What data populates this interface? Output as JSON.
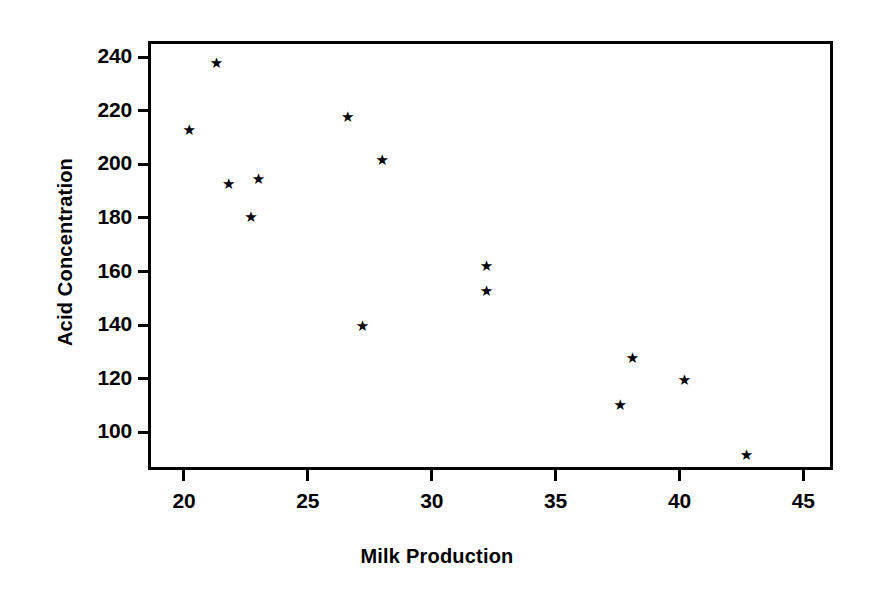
{
  "chart_data": {
    "type": "scatter",
    "title": "",
    "xlabel": "Milk Production",
    "ylabel": "Acid Concentration",
    "xlim": [
      18.55,
      46.2
    ],
    "ylim": [
      86.0,
      246.0
    ],
    "xticks": [
      20,
      25,
      30,
      35,
      40,
      45
    ],
    "yticks": [
      100,
      120,
      140,
      160,
      180,
      200,
      220,
      240
    ],
    "xtick_labels": [
      "20",
      "25",
      "30",
      "35",
      "40",
      "45"
    ],
    "ytick_labels": [
      "100",
      "120",
      "140",
      "160",
      "180",
      "200",
      "220",
      "240"
    ],
    "grid": false,
    "legend": null,
    "marker": "star",
    "marker_color": "#000000",
    "background_color": "#ffffff",
    "frame_color": "#000000",
    "series": [
      {
        "name": "observations",
        "points": [
          {
            "x": 20.2,
            "y": 212.5
          },
          {
            "x": 21.3,
            "y": 237.5
          },
          {
            "x": 21.8,
            "y": 192.5
          },
          {
            "x": 22.7,
            "y": 180.0
          },
          {
            "x": 23.0,
            "y": 194.5
          },
          {
            "x": 26.6,
            "y": 217.5
          },
          {
            "x": 27.2,
            "y": 139.5
          },
          {
            "x": 28.0,
            "y": 201.5
          },
          {
            "x": 32.2,
            "y": 162.0
          },
          {
            "x": 32.2,
            "y": 152.5
          },
          {
            "x": 37.6,
            "y": 110.0
          },
          {
            "x": 38.1,
            "y": 127.5
          },
          {
            "x": 40.2,
            "y": 119.5
          },
          {
            "x": 42.7,
            "y": 91.5
          }
        ]
      }
    ]
  }
}
